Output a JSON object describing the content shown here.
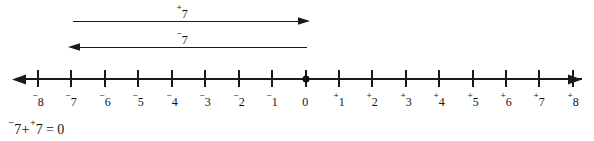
{
  "diagram": {
    "line_color": "#1a1a1a",
    "background_color": "#ffffff",
    "axis": {
      "name": "number-line",
      "min": -8,
      "max": 8,
      "origin_marker": "filled-dot",
      "left_arrowhead": true,
      "right_arrowhead": true,
      "ticks": [
        {
          "value": -8,
          "sign": "⁻",
          "digit": "8"
        },
        {
          "value": -7,
          "sign": "⁻",
          "digit": "7"
        },
        {
          "value": -6,
          "sign": "⁻",
          "digit": "6"
        },
        {
          "value": -5,
          "sign": "⁻",
          "digit": "5"
        },
        {
          "value": -4,
          "sign": "⁻",
          "digit": "4"
        },
        {
          "value": -3,
          "sign": "⁻",
          "digit": "3"
        },
        {
          "value": -2,
          "sign": "⁻",
          "digit": "2"
        },
        {
          "value": -1,
          "sign": "⁻",
          "digit": "1"
        },
        {
          "value": 0,
          "sign": "",
          "digit": "0"
        },
        {
          "value": 1,
          "sign": "⁺",
          "digit": "1"
        },
        {
          "value": 2,
          "sign": "⁺",
          "digit": "2"
        },
        {
          "value": 3,
          "sign": "⁺",
          "digit": "3"
        },
        {
          "value": 4,
          "sign": "⁺",
          "digit": "4"
        },
        {
          "value": 5,
          "sign": "⁺",
          "digit": "5"
        },
        {
          "value": 6,
          "sign": "⁺",
          "digit": "6"
        },
        {
          "value": 7,
          "sign": "⁺",
          "digit": "7"
        },
        {
          "value": 8,
          "sign": "⁺",
          "digit": "8"
        }
      ]
    },
    "arrows": [
      {
        "name": "positive-seven-arrow",
        "sign": "⁺",
        "magnitude": "7",
        "direction": "right",
        "from_value": -7,
        "to_value": 0
      },
      {
        "name": "negative-seven-arrow",
        "sign": "⁻",
        "magnitude": "7",
        "direction": "left",
        "from_value": 0,
        "to_value": -7
      }
    ],
    "equation": {
      "left_sign": "⁻",
      "left_term": "7",
      "operator": "+",
      "right_sign": "⁺",
      "right_term": "7",
      "equals": "=",
      "result": "0",
      "full_text": "⁻7+⁺7 = 0"
    }
  }
}
